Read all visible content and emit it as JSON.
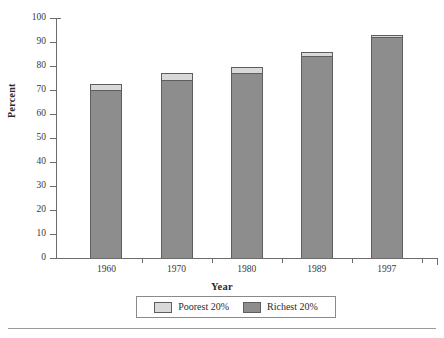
{
  "chart_data": {
    "type": "bar",
    "subtype": "stacked-bar",
    "title": "",
    "xlabel": "Year",
    "ylabel": "Percent",
    "categories": [
      "1960",
      "1970",
      "1980",
      "1989",
      "1997"
    ],
    "series": [
      {
        "name": "Richest 20%",
        "color": "#8d8d8d",
        "values": [
          70,
          74,
          77,
          84,
          92
        ]
      },
      {
        "name": "Poorest 20%",
        "color": "#d9d9d9",
        "values": [
          2.5,
          3,
          2.5,
          2,
          1
        ]
      }
    ],
    "totals": [
      72.5,
      77,
      79.5,
      86,
      93
    ],
    "ylim": [
      0,
      100
    ],
    "ytick_labels": [
      "0",
      "10",
      "20",
      "30",
      "40",
      "50",
      "60",
      "70",
      "80",
      "90",
      "100"
    ],
    "ytick_values": [
      0,
      10,
      20,
      30,
      40,
      50,
      60,
      70,
      80,
      90,
      100
    ],
    "grid": false,
    "legend_position": "bottom",
    "legend_entries": [
      "Poorest 20%",
      "Richest 20%"
    ]
  },
  "axes": {
    "y_title": "Percent",
    "x_title": "Year"
  },
  "legend": {
    "poorest_label": "Poorest 20%",
    "richest_label": "Richest 20%",
    "poorest_color": "#d9d9d9",
    "richest_color": "#8d8d8d"
  }
}
